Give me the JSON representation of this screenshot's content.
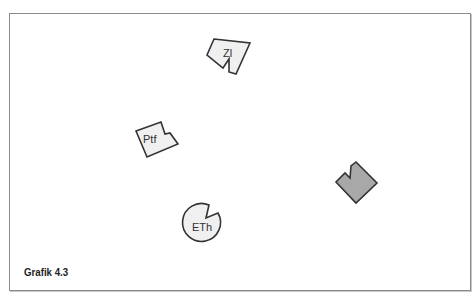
{
  "figure": {
    "caption": "Grafik 4.3",
    "shapes": [
      {
        "id": "zl",
        "label": "Zl",
        "type": "notched-square",
        "fill": "#f0f0f0",
        "stroke": "#333333"
      },
      {
        "id": "ptf",
        "label": "Ptf",
        "type": "notched-square",
        "fill": "#f0f0f0",
        "stroke": "#333333"
      },
      {
        "id": "eth",
        "label": "ETh",
        "type": "notched-circle",
        "fill": "#f0f0f0",
        "stroke": "#333333"
      },
      {
        "id": "unlabeled",
        "label": "",
        "type": "notched-square",
        "fill": "#a8a8a8",
        "stroke": "#333333"
      }
    ]
  },
  "colors": {
    "light_fill": "#f0f0f0",
    "dark_fill": "#a8a8a8",
    "stroke": "#333333",
    "frame": "#8a8a8a"
  }
}
